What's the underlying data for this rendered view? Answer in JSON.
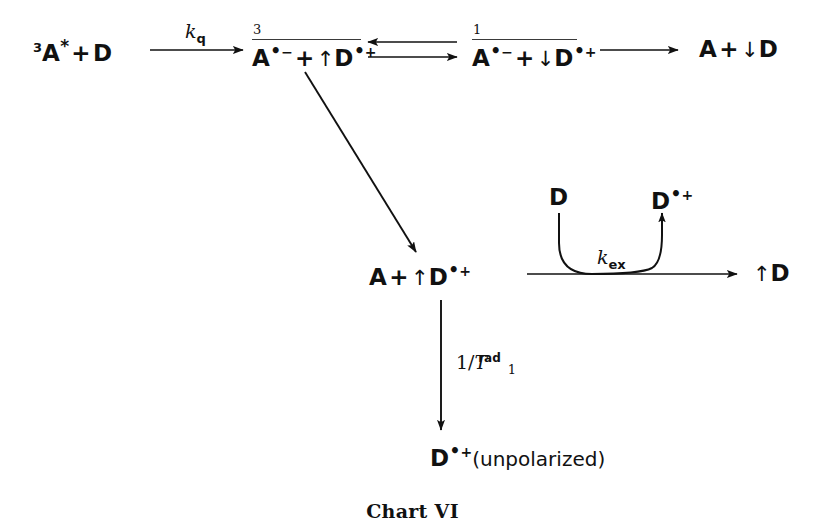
{
  "figure": {
    "caption": "Chart VI",
    "ink_color": "#111111"
  },
  "scheme": {
    "reactants": {
      "multiplicity": "3",
      "acceptor": "A",
      "excited_mark": "*",
      "operator": "+",
      "donor": "D",
      "full_text": "3A* + D"
    },
    "triplet_pair": {
      "multiplicity": "3",
      "anion": "A",
      "anion_radical_dot": "•",
      "anion_charge": "−",
      "operator": "+",
      "spin": "↑",
      "cation": "D",
      "cation_radical_dot": "•",
      "cation_charge": "+",
      "full_text": "3[A•− + ↑D•+]"
    },
    "singlet_pair": {
      "multiplicity": "1",
      "anion": "A",
      "anion_radical_dot": "•",
      "anion_charge": "−",
      "operator": "+",
      "spin": "↓",
      "cation": "D",
      "cation_radical_dot": "•",
      "cation_charge": "+",
      "full_text": "1[A•− + ↓D•+]"
    },
    "recombination_products": {
      "acceptor": "A",
      "operator": "+",
      "spin": "↓",
      "donor": "D",
      "full_text": "A + ↓D"
    },
    "escape_products": {
      "acceptor": "A",
      "operator": "+",
      "spin": "↑",
      "cation": "D",
      "cation_radical_dot": "•",
      "cation_charge": "+",
      "full_text": "A + ↑D•+"
    },
    "exchange_reactant": {
      "donor": "D",
      "full_text": "D"
    },
    "exchange_product": {
      "cation": "D",
      "cation_radical_dot": "•",
      "cation_charge": "+",
      "full_text": "D•+"
    },
    "polarized_donor": {
      "spin": "↑",
      "donor": "D",
      "full_text": "↑D"
    },
    "relaxed_product": {
      "cation": "D",
      "cation_radical_dot": "•",
      "cation_charge": "+",
      "note": "(unpolarized)",
      "full_text": "D•+(unpolarized)"
    }
  },
  "rate_labels": {
    "quenching": {
      "symbol": "k",
      "subscript": "q",
      "full_text": "kq"
    },
    "exchange": {
      "symbol": "k",
      "subscript": "ex",
      "full_text": "kex"
    },
    "relaxation": {
      "prefix": "1/",
      "symbol": "T",
      "subscript": "1",
      "superscript": "rad",
      "full_text": "1/T1rad"
    }
  },
  "arrows": {
    "quenching_arrow": "single-right-arrow",
    "equilibrium_arrows": "double-equilibrium-arrow",
    "recombination_arrow": "single-right-arrow",
    "escape_arrow": "diagonal-down-right-arrow",
    "exchange_horizontal_arrow": "single-right-arrow",
    "exchange_curve": "u-shaped-curved-arrow",
    "relaxation_arrow": "single-down-arrow"
  }
}
